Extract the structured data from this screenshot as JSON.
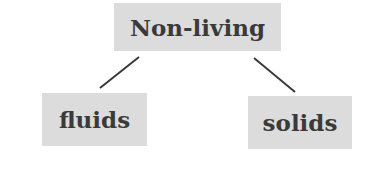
{
  "diagram": {
    "root": {
      "label": "Non-living"
    },
    "children": [
      {
        "label": "fluids"
      },
      {
        "label": "solids"
      }
    ],
    "colors": {
      "box_fill": "#dcdcdc",
      "text": "#3a3a3a",
      "line": "#3a3a3a"
    }
  }
}
